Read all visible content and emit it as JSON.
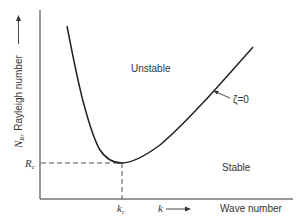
{
  "diagram": {
    "type": "stability-curve",
    "ylabel": {
      "symbol": "N",
      "subscript": "R",
      "text": ", Rayleigh number"
    },
    "xlabel": {
      "symbol": "k",
      "text": "Wave number"
    },
    "regions": {
      "upper": "Unstable",
      "lower": "Stable"
    },
    "curve_label": "ζ=0",
    "critical": {
      "y_label_main": "R",
      "y_label_sub": "c",
      "x_label_main": "k",
      "x_label_sub": "c"
    },
    "colors": {
      "line": "#222222",
      "text": "#333333",
      "background": "#ffffff"
    }
  }
}
